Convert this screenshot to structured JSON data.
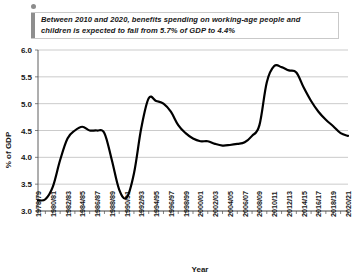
{
  "callout": {
    "dot_icon": "bullet-dot-icon",
    "text": "Between 2010 and 2020, benefits spending on working-age people and children is expected to fall from 5.7% of GDP to 4.4%",
    "accent_color": "#8e8e8e"
  },
  "chart_data": {
    "type": "line",
    "title": "",
    "xlabel": "Year",
    "ylabel": "% of GDP",
    "ylim": [
      3.0,
      6.0
    ],
    "yticks": [
      "3.0",
      "3.5",
      "4.0",
      "4.5",
      "5.0",
      "5.5",
      "6.0"
    ],
    "ytick_values": [
      3.0,
      3.5,
      4.0,
      4.5,
      5.0,
      5.5,
      6.0
    ],
    "grid": true,
    "legend": "none",
    "line_color": "#000000",
    "categories": [
      "1978/79",
      "1979/80",
      "1980/81",
      "1981/82",
      "1982/83",
      "1983/84",
      "1984/85",
      "1985/86",
      "1986/87",
      "1987/88",
      "1988/89",
      "1989/90",
      "1990/91",
      "1991/92",
      "1992/93",
      "1993/94",
      "1994/95",
      "1995/96",
      "1996/97",
      "1997/98",
      "1998/99",
      "1999/00",
      "2000/01",
      "2001/02",
      "2002/03",
      "2003/04",
      "2004/05",
      "2005/06",
      "2006/07",
      "2007/08",
      "2008/09",
      "2009/10",
      "2010/11",
      "2011/12",
      "2012/13",
      "2013/14",
      "2014/15",
      "2015/16",
      "2016/17",
      "2017/18",
      "2018/19",
      "2019/20",
      "2020/21"
    ],
    "xtick_labels": [
      "1978/79",
      "1980/81",
      "1982/83",
      "1984/85",
      "1986/87",
      "1988/89",
      "1990/91",
      "1992/93",
      "1994/95",
      "1996/97",
      "1998/99",
      "2000/01",
      "2002/03",
      "2004/05",
      "2006/07",
      "2008/09",
      "2010/11",
      "2012/13",
      "2014/15",
      "2016/17",
      "2018/19",
      "2020/21"
    ],
    "values": [
      3.2,
      3.22,
      3.45,
      3.95,
      4.35,
      4.5,
      4.57,
      4.5,
      4.5,
      4.45,
      3.95,
      3.4,
      3.25,
      3.7,
      4.55,
      5.1,
      5.05,
      5.0,
      4.85,
      4.6,
      4.45,
      4.35,
      4.3,
      4.3,
      4.25,
      4.22,
      4.23,
      4.25,
      4.28,
      4.4,
      4.6,
      5.4,
      5.7,
      5.68,
      5.62,
      5.58,
      5.3,
      5.05,
      4.85,
      4.7,
      4.58,
      4.45,
      4.4
    ],
    "annotations": {
      "2010_value": "5.7",
      "2020_value": "4.4"
    }
  }
}
